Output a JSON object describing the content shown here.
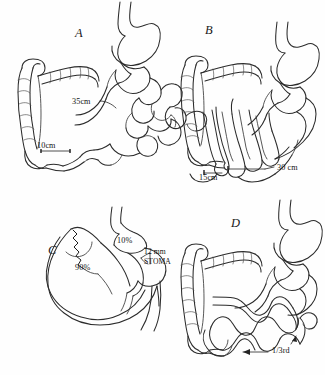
{
  "figure": {
    "background_color": "#fefefe",
    "ink_color": "#2b2b2b",
    "panel_count": 4
  },
  "panels": [
    {
      "id": "A",
      "letter": "A",
      "letter_pos": {
        "x": 75,
        "y": 26
      },
      "description": "Normal stomach with small bowel loops and colon; jejunal and ileal limb lengths marked",
      "labels": [
        {
          "key": "limb_proximal",
          "text": "35cm",
          "x": 72,
          "y": 97
        },
        {
          "key": "limb_distal",
          "text": "10cm",
          "x": 37,
          "y": 141
        }
      ]
    },
    {
      "id": "B",
      "letter": "B",
      "letter_pos": {
        "x": 205,
        "y": 23
      },
      "description": "Stomach with densely coiled small bowel loops and colon; bypass limb lengths marked",
      "labels": [
        {
          "key": "limb_distal",
          "text": "15cm",
          "x": 199,
          "y": 173
        },
        {
          "key": "limb_proximal",
          "text": "30 cm",
          "x": 277,
          "y": 163
        }
      ]
    },
    {
      "id": "C",
      "letter": "C",
      "letter_pos": {
        "x": 48,
        "y": 243
      },
      "description": "Gastric partition showing small proximal pouch and large bypassed remnant with a stoma",
      "labels": [
        {
          "key": "pouch_share",
          "text": "10%",
          "x": 117,
          "y": 236
        },
        {
          "key": "stoma_size",
          "text": "12 mm",
          "x": 144,
          "y": 249
        },
        {
          "key": "stoma_name",
          "text": "STOMA",
          "x": 144,
          "y": 259
        },
        {
          "key": "remnant_share",
          "text": "90%",
          "x": 75,
          "y": 263
        }
      ]
    },
    {
      "id": "D",
      "letter": "D",
      "letter_pos": {
        "x": 231,
        "y": 216
      },
      "description": "Stomach with colon and long serpentine small bowel limbs; distal third of bowel indicated",
      "labels": [
        {
          "key": "bowel_fraction",
          "text": "1/3rd",
          "x": 272,
          "y": 350
        }
      ]
    }
  ],
  "annotations": {
    "arrow_fraction": {
      "name": "left-arrow",
      "points_to": "distal small bowel",
      "direction": "left"
    },
    "stoma_bracket": {
      "name": "stoma-leader",
      "points_to": "gastrojejunal stoma"
    }
  }
}
